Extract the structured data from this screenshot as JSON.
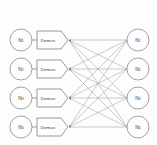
{
  "diagram": {
    "type": "bipartite-network",
    "background_color": "#fdfdfd",
    "line_color": "#8c8c8c",
    "stroke_color": "#7a7a7a",
    "text_color": "#3a3a3a",
    "left_nodes": [
      {
        "base": "N",
        "sub": "1",
        "cx": 21,
        "cy": 40,
        "r": 11
      },
      {
        "base": "N",
        "sub": "2",
        "cx": 21,
        "cy": 69,
        "r": 11
      },
      {
        "base": "N",
        "sub": "3",
        "cx": 21,
        "cy": 98,
        "r": 11
      },
      {
        "base": "N",
        "sub": "4",
        "cx": 21,
        "cy": 127,
        "r": 11
      }
    ],
    "demux_blocks": [
      {
        "label": "Demux",
        "x": 37,
        "y": 31,
        "w": 24,
        "h": 18,
        "tip": 7
      },
      {
        "label": "Demux",
        "x": 37,
        "y": 60,
        "w": 24,
        "h": 18,
        "tip": 7
      },
      {
        "label": "Demux",
        "x": 37,
        "y": 89,
        "w": 24,
        "h": 18,
        "tip": 7
      },
      {
        "label": "Demux",
        "x": 37,
        "y": 118,
        "w": 24,
        "h": 18,
        "tip": 7
      }
    ],
    "right_nodes": [
      {
        "base": "N",
        "sub": "1",
        "cx": 138,
        "cy": 40,
        "r": 11
      },
      {
        "base": "N",
        "sub": "2",
        "cx": 138,
        "cy": 69,
        "r": 11
      },
      {
        "base": "N",
        "sub": "3",
        "cx": 138,
        "cy": 98,
        "r": 11
      },
      {
        "base": "N",
        "sub": "4",
        "cx": 138,
        "cy": 127,
        "r": 11
      }
    ],
    "stub_connectors": [
      {
        "x1": 32,
        "y1": 40,
        "x2": 37,
        "y2": 40
      },
      {
        "x1": 32,
        "y1": 69,
        "x2": 37,
        "y2": 69
      },
      {
        "x1": 32,
        "y1": 98,
        "x2": 37,
        "y2": 98
      },
      {
        "x1": 32,
        "y1": 127,
        "x2": 37,
        "y2": 127
      }
    ],
    "mesh_edges": [
      {
        "from": "right-1",
        "to": "demux-1",
        "x1": 127,
        "y1": 40,
        "x2": 69,
        "y2": 40
      },
      {
        "from": "right-2",
        "to": "demux-1",
        "x1": 127,
        "y1": 69,
        "x2": 69,
        "y2": 40
      },
      {
        "from": "right-3",
        "to": "demux-1",
        "x1": 127,
        "y1": 98,
        "x2": 69,
        "y2": 40
      },
      {
        "from": "right-4",
        "to": "demux-1",
        "x1": 127,
        "y1": 127,
        "x2": 69,
        "y2": 40
      },
      {
        "from": "right-1",
        "to": "demux-2",
        "x1": 127,
        "y1": 40,
        "x2": 69,
        "y2": 69
      },
      {
        "from": "right-2",
        "to": "demux-2",
        "x1": 127,
        "y1": 69,
        "x2": 69,
        "y2": 69
      },
      {
        "from": "right-3",
        "to": "demux-2",
        "x1": 127,
        "y1": 98,
        "x2": 69,
        "y2": 69
      },
      {
        "from": "right-4",
        "to": "demux-2",
        "x1": 127,
        "y1": 127,
        "x2": 69,
        "y2": 69
      },
      {
        "from": "right-1",
        "to": "demux-3",
        "x1": 127,
        "y1": 40,
        "x2": 69,
        "y2": 98
      },
      {
        "from": "right-2",
        "to": "demux-3",
        "x1": 127,
        "y1": 69,
        "x2": 69,
        "y2": 98
      },
      {
        "from": "right-3",
        "to": "demux-3",
        "x1": 127,
        "y1": 98,
        "x2": 69,
        "y2": 98
      },
      {
        "from": "right-4",
        "to": "demux-3",
        "x1": 127,
        "y1": 127,
        "x2": 69,
        "y2": 98
      },
      {
        "from": "right-1",
        "to": "demux-4",
        "x1": 127,
        "y1": 40,
        "x2": 69,
        "y2": 127
      },
      {
        "from": "right-2",
        "to": "demux-4",
        "x1": 127,
        "y1": 69,
        "x2": 69,
        "y2": 127
      },
      {
        "from": "right-3",
        "to": "demux-4",
        "x1": 127,
        "y1": 98,
        "x2": 69,
        "y2": 127
      },
      {
        "from": "right-4",
        "to": "demux-4",
        "x1": 127,
        "y1": 127,
        "x2": 69,
        "y2": 127
      }
    ]
  }
}
